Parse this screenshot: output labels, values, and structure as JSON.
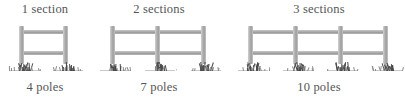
{
  "canvas": {
    "width": 401,
    "height": 101,
    "background": "#ffffff"
  },
  "style": {
    "text_color": "#555555",
    "post_color": "#b2b2b2",
    "rail_color": "#a9a9a9",
    "grass_color": "#4a4a4a"
  },
  "figure": {
    "groups": [
      {
        "id": "fence-1",
        "top_label": "1 section",
        "bottom_label": "4 poles",
        "sections": 1,
        "posts": 2,
        "poles": 4,
        "left": 4,
        "width": 82,
        "post_x": [
          15,
          59
        ],
        "rail_x": 15,
        "rail_w": 49
      },
      {
        "id": "fence-2",
        "top_label": "2 sections",
        "bottom_label": "7 poles",
        "sections": 2,
        "posts": 3,
        "poles": 7,
        "left": 104,
        "width": 110,
        "post_x": [
          6,
          51,
          97
        ],
        "rail_x": 6,
        "rail_w": 96
      },
      {
        "id": "fence-3",
        "top_label": "3 sections",
        "bottom_label": "10 poles",
        "sections": 3,
        "posts": 4,
        "poles": 10,
        "left": 243,
        "width": 152,
        "post_x": [
          5,
          50,
          95,
          140
        ],
        "rail_x": 5,
        "rail_w": 140
      }
    ]
  }
}
